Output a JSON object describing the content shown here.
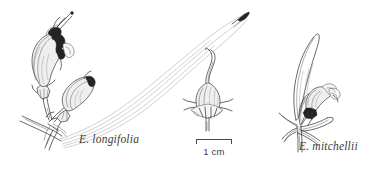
{
  "plate": {
    "background_color": "#ffffff",
    "ink_color": "#2b2b2b",
    "width": 373,
    "height": 171,
    "subject": "botanical-line-illustration"
  },
  "specimens": [
    {
      "id": "left",
      "label": "E. longifolia",
      "parts": "flowering-branch-with-two-tubular-flowers-and-long-curved-leaf"
    },
    {
      "id": "center",
      "label": "",
      "parts": "fruit-with-persistent-style-and-star-calyx"
    },
    {
      "id": "right",
      "label": "E. mitchellii",
      "parts": "leafy-shoot-with-short-bell-flower"
    }
  ],
  "labels": {
    "longifolia": "E. longifolia",
    "mitchellii": "E. mitchellii"
  },
  "scale": {
    "caption": "1 cm",
    "length_px": 36
  }
}
